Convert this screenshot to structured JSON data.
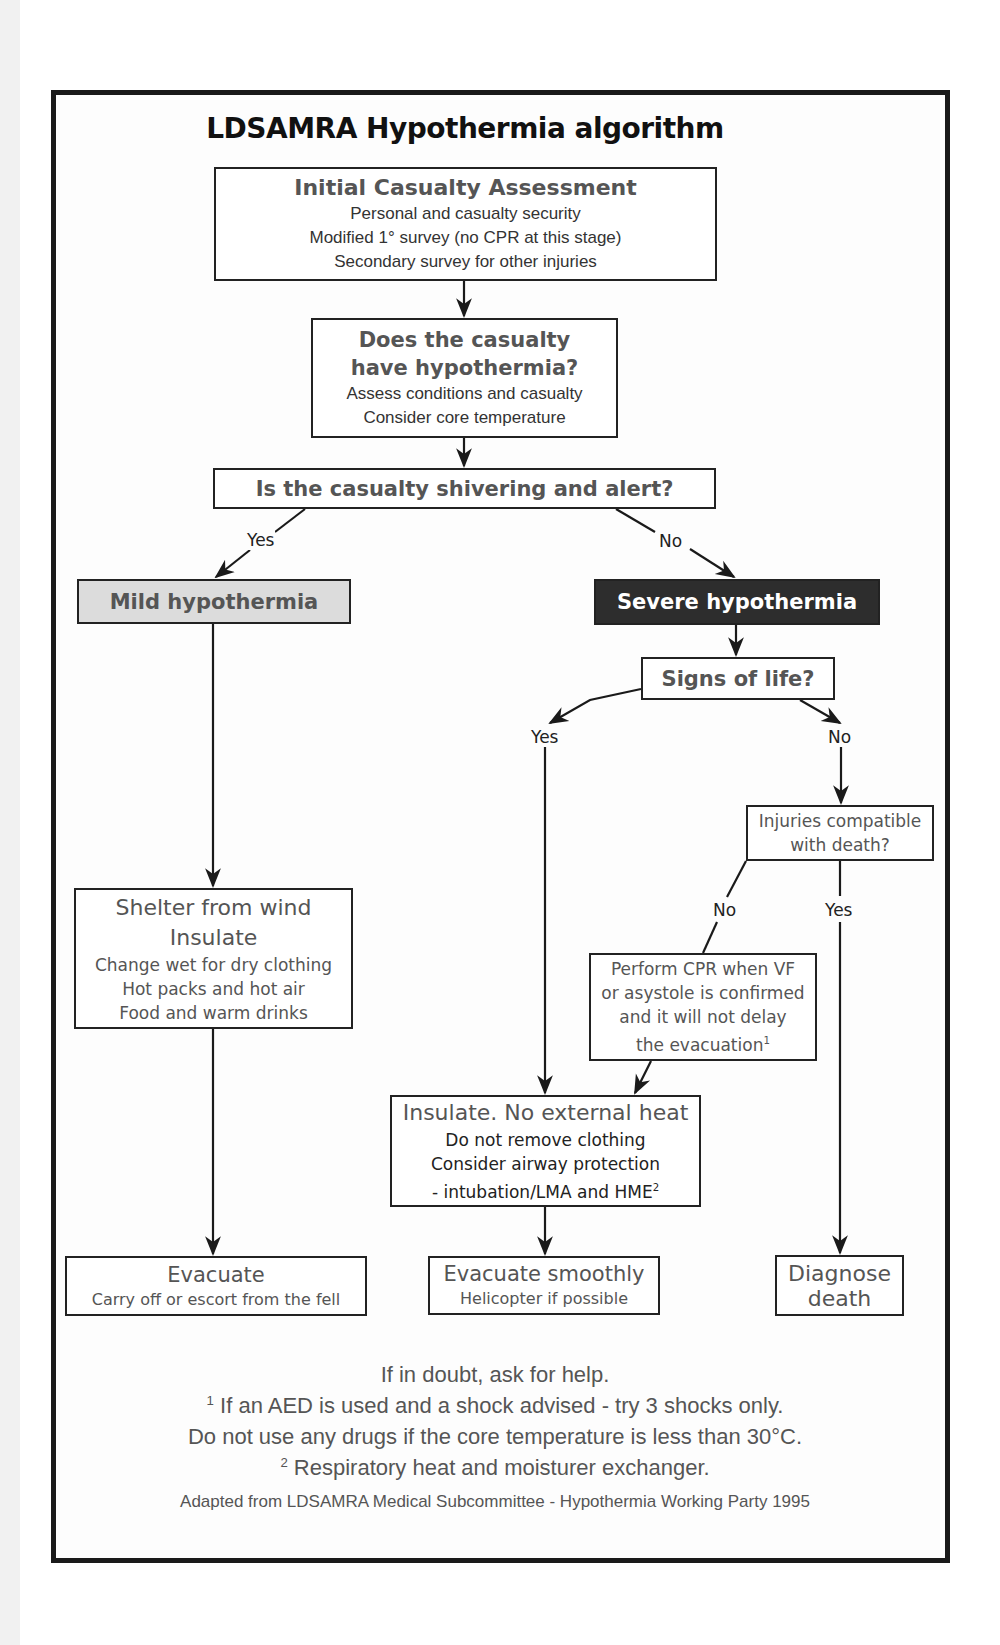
{
  "title": "LDSAMRA Hypothermia algorithm",
  "nodes": {
    "initial": {
      "heading": "Initial Casualty Assessment",
      "lines": [
        "Personal and casualty security",
        "Modified 1° survey (no CPR at this stage)",
        "Secondary survey for other injuries"
      ]
    },
    "does_have": {
      "heading_1": "Does the casualty",
      "heading_2": "have hypothermia?",
      "lines": [
        "Assess conditions and casualty",
        "Consider core temperature"
      ]
    },
    "shivering": {
      "heading": "Is the casualty shivering and alert?"
    },
    "mild": {
      "heading": "Mild hypothermia",
      "fill": "#dcdcdc"
    },
    "severe": {
      "heading": "Severe hypothermia",
      "fill": "#2d2d2d"
    },
    "signs": {
      "heading": "Signs of life?"
    },
    "injuries": {
      "lines": [
        "Injuries compatible",
        "with death?"
      ]
    },
    "shelter": {
      "title_lines": [
        "Shelter from wind",
        "Insulate"
      ],
      "lines": [
        "Change wet for dry clothing",
        "Hot packs and hot air",
        "Food and warm drinks"
      ]
    },
    "cpr": {
      "lines": [
        "Perform CPR when VF",
        "or asystole is confirmed",
        "and it will not delay",
        "the evacuation"
      ],
      "footnote_ref": "1"
    },
    "insulate": {
      "heading": "Insulate. No external heat",
      "lines": [
        "Do not remove clothing",
        "Consider airway protection",
        "- intubation/LMA and HME"
      ],
      "footnote_ref": "2"
    },
    "evacuate": {
      "heading": "Evacuate",
      "sub": "Carry off or escort from the fell"
    },
    "evacuate_smoothly": {
      "heading": "Evacuate smoothly",
      "sub": "Helicopter if possible"
    },
    "diagnose": {
      "lines": [
        "Diagnose",
        "death"
      ]
    }
  },
  "edge_labels": {
    "shivering_yes": "Yes",
    "shivering_no": "No",
    "signs_yes": "Yes",
    "signs_no": "No",
    "injuries_no": "No",
    "injuries_yes": "Yes"
  },
  "footer": {
    "line1": "If in doubt, ask for help.",
    "line2_ref": "1",
    "line2": " If an AED is used and a shock advised - try 3 shocks only.",
    "line3": "Do not use any drugs if the core temperature is less than 30°C.",
    "line4_ref": "2",
    "line4": " Respiratory heat and moisturer exchanger.",
    "credit": "Adapted from LDSAMRA Medical Subcommittee - Hypothermia Working Party 1995"
  }
}
